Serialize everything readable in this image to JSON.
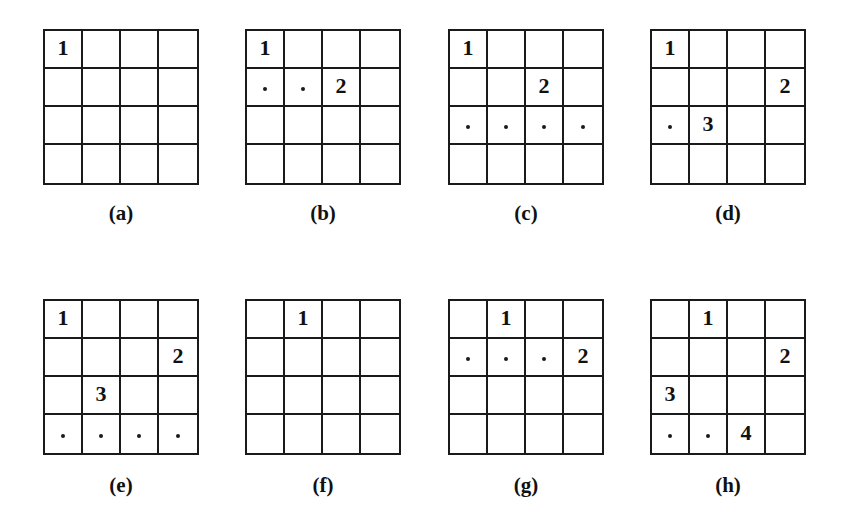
{
  "figure": {
    "board_size": 4,
    "panels": [
      {
        "id": "a",
        "label": "(a)",
        "queens": [
          {
            "number": "1",
            "row": 0,
            "col": 0
          }
        ],
        "dots": []
      },
      {
        "id": "b",
        "label": "(b)",
        "queens": [
          {
            "number": "1",
            "row": 0,
            "col": 0
          },
          {
            "number": "2",
            "row": 1,
            "col": 2
          }
        ],
        "dots": [
          {
            "row": 1,
            "col": 0
          },
          {
            "row": 1,
            "col": 1
          }
        ]
      },
      {
        "id": "c",
        "label": "(c)",
        "queens": [
          {
            "number": "1",
            "row": 0,
            "col": 0
          },
          {
            "number": "2",
            "row": 1,
            "col": 2
          }
        ],
        "dots": [
          {
            "row": 2,
            "col": 0
          },
          {
            "row": 2,
            "col": 1
          },
          {
            "row": 2,
            "col": 2
          },
          {
            "row": 2,
            "col": 3
          }
        ]
      },
      {
        "id": "d",
        "label": "(d)",
        "queens": [
          {
            "number": "1",
            "row": 0,
            "col": 0
          },
          {
            "number": "2",
            "row": 1,
            "col": 3
          },
          {
            "number": "3",
            "row": 2,
            "col": 1
          }
        ],
        "dots": [
          {
            "row": 2,
            "col": 0
          }
        ]
      },
      {
        "id": "e",
        "label": "(e)",
        "queens": [
          {
            "number": "1",
            "row": 0,
            "col": 0
          },
          {
            "number": "2",
            "row": 1,
            "col": 3
          },
          {
            "number": "3",
            "row": 2,
            "col": 1
          }
        ],
        "dots": [
          {
            "row": 3,
            "col": 0
          },
          {
            "row": 3,
            "col": 1
          },
          {
            "row": 3,
            "col": 2
          },
          {
            "row": 3,
            "col": 3
          }
        ]
      },
      {
        "id": "f",
        "label": "(f)",
        "queens": [
          {
            "number": "1",
            "row": 0,
            "col": 1
          }
        ],
        "dots": []
      },
      {
        "id": "g",
        "label": "(g)",
        "queens": [
          {
            "number": "1",
            "row": 0,
            "col": 1
          },
          {
            "number": "2",
            "row": 1,
            "col": 3
          }
        ],
        "dots": [
          {
            "row": 1,
            "col": 0
          },
          {
            "row": 1,
            "col": 1
          },
          {
            "row": 1,
            "col": 2
          }
        ]
      },
      {
        "id": "h",
        "label": "(h)",
        "queens": [
          {
            "number": "1",
            "row": 0,
            "col": 1
          },
          {
            "number": "2",
            "row": 1,
            "col": 3
          },
          {
            "number": "3",
            "row": 2,
            "col": 0
          },
          {
            "number": "4",
            "row": 3,
            "col": 2
          }
        ],
        "dots": [
          {
            "row": 3,
            "col": 0
          },
          {
            "row": 3,
            "col": 1
          }
        ]
      }
    ]
  },
  "colors": {
    "line": "#1a1a1a",
    "background": "#ffffff",
    "text": "#111111"
  }
}
